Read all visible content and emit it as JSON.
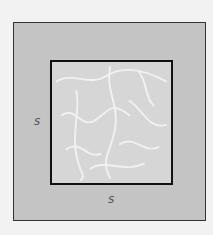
{
  "diagram": {
    "outer_region": {
      "name": "deck",
      "color": "#c4c4c4"
    },
    "inner_region": {
      "name": "pool",
      "color": "#d6d6d6",
      "texture": "water caustics"
    },
    "labels": {
      "left": "s",
      "bottom": "s"
    }
  }
}
